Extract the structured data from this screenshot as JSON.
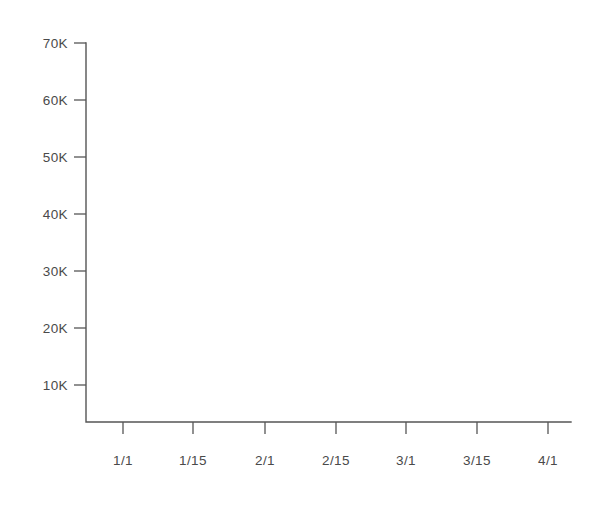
{
  "chart_data": {
    "type": "line",
    "title": "",
    "subtitle": "",
    "xlabel": "",
    "ylabel": "",
    "legend": [],
    "annotations": [],
    "grid": false,
    "series": [],
    "empty": true,
    "x_tick_labels": [
      "1/1",
      "1/15",
      "2/1",
      "2/15",
      "3/1",
      "3/15",
      "4/1"
    ],
    "x_tick_positions": [
      123,
      193,
      265,
      336,
      406,
      477,
      548
    ],
    "y_tick_labels": [
      "70K",
      "60K",
      "50K",
      "40K",
      "30K",
      "20K",
      "10K"
    ],
    "y_tick_values": [
      70000,
      60000,
      50000,
      40000,
      30000,
      20000,
      10000
    ],
    "y_tick_positions": [
      43,
      100,
      157,
      214,
      271,
      328,
      385
    ],
    "ylim": [
      0,
      70000
    ],
    "axis_color": "#555555",
    "label_color": "#4a4a4a",
    "background_color": "#ffffff"
  },
  "geometry": {
    "axis_x": 86,
    "axis_y_bottom": 422,
    "axis_y_top": 43,
    "axis_x_right": 571,
    "tick_length": 12,
    "ylabel_right_edge": 68,
    "xlabel_top": 455
  }
}
